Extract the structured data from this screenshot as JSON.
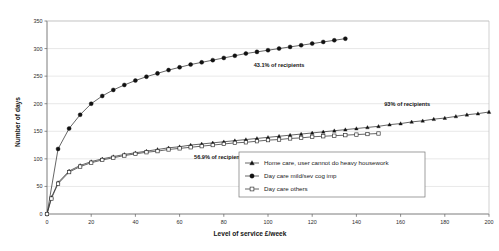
{
  "chart_data": {
    "type": "line",
    "title": "",
    "xlabel": "Level of service £/week",
    "ylabel": "Number of days",
    "xlim": [
      0,
      200
    ],
    "ylim": [
      0,
      350
    ],
    "xticks": [
      0,
      20,
      40,
      60,
      80,
      100,
      120,
      140,
      160,
      180,
      200
    ],
    "yticks": [
      0,
      50,
      100,
      150,
      200,
      250,
      300,
      350
    ],
    "grid": "horizontal",
    "legend_position": "bottom-center",
    "series": [
      {
        "name": "Home care, user cannot do heavy housework",
        "marker": "filled-triangle",
        "x": [
          0,
          2,
          5,
          10,
          15,
          20,
          25,
          30,
          35,
          40,
          45,
          50,
          55,
          60,
          65,
          70,
          75,
          80,
          85,
          90,
          95,
          100,
          105,
          110,
          115,
          120,
          125,
          130,
          135,
          140,
          145,
          150,
          155,
          160,
          165,
          170,
          175,
          180,
          185,
          190,
          195,
          200
        ],
        "y": [
          0,
          30,
          57,
          78,
          88,
          95,
          100,
          104,
          108,
          111,
          114,
          117,
          120,
          122,
          125,
          127,
          129,
          131,
          133,
          135,
          137,
          139,
          141,
          143,
          145,
          147,
          149,
          151,
          153,
          155,
          157,
          159,
          162,
          164,
          167,
          169,
          172,
          174,
          177,
          180,
          182,
          185
        ]
      },
      {
        "name": "Day care mild/sev cog imp",
        "marker": "filled-circle",
        "x": [
          0,
          5,
          10,
          15,
          20,
          25,
          30,
          35,
          40,
          45,
          50,
          55,
          60,
          65,
          70,
          75,
          80,
          85,
          90,
          95,
          100,
          105,
          110,
          115,
          120,
          125,
          130,
          135
        ],
        "y": [
          0,
          118,
          155,
          180,
          200,
          214,
          225,
          234,
          242,
          249,
          255,
          261,
          266,
          271,
          275,
          279,
          283,
          287,
          291,
          294,
          297,
          300,
          303,
          306,
          309,
          312,
          315,
          318
        ]
      },
      {
        "name": "Day care others",
        "marker": "open-square",
        "x": [
          0,
          2,
          5,
          10,
          15,
          20,
          25,
          30,
          35,
          40,
          45,
          50,
          55,
          60,
          65,
          70,
          75,
          80,
          85,
          90,
          95,
          100,
          105,
          110,
          115,
          120,
          125,
          130,
          135,
          140,
          145,
          150
        ],
        "y": [
          0,
          28,
          55,
          76,
          86,
          93,
          98,
          102,
          106,
          109,
          112,
          114,
          117,
          119,
          121,
          123,
          125,
          127,
          129,
          130,
          132,
          134,
          135,
          137,
          138,
          140,
          141,
          142,
          143,
          144,
          145,
          146
        ]
      }
    ],
    "annotations": [
      {
        "text": "43.1% of recipients",
        "x": 105,
        "y": 267
      },
      {
        "text": "93% of recipients",
        "x": 163,
        "y": 196
      },
      {
        "text": "56.9% of recipients",
        "x": 78,
        "y": 100
      }
    ]
  },
  "legend": {
    "items": [
      {
        "label": "Home care, user cannot do heavy housework",
        "marker": "filled-triangle"
      },
      {
        "label": "Day care mild/sev cog imp",
        "marker": "filled-circle"
      },
      {
        "label": "Day care others",
        "marker": "open-square"
      }
    ]
  }
}
